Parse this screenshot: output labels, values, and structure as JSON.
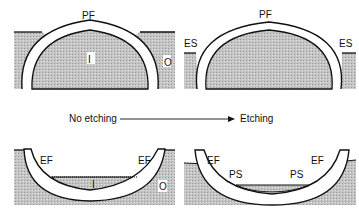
{
  "panels": {
    "top_left": {
      "membrane_label": "PF",
      "inner_label": "I",
      "outer_label": "O"
    },
    "top_right": {
      "membrane_label": "PF",
      "left_label": "ES",
      "right_label": "ES"
    },
    "bottom_left": {
      "left_label": "EF",
      "right_label": "EF",
      "inner_label": "I",
      "outer_label": "O"
    },
    "bottom_right": {
      "left_label": "EF",
      "right_label": "EF",
      "left_inner_label": "PS",
      "right_inner_label": "PS"
    }
  },
  "arrow": {
    "from_label": "No etching",
    "to_label": "Etching"
  },
  "colors": {
    "stipple": "#bdbdbd",
    "line": "#111111",
    "background": "#ffffff"
  }
}
